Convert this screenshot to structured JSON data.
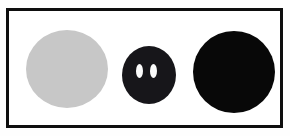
{
  "figure": {
    "title": "",
    "caption": "",
    "background_color": "#fefefe",
    "frame": {
      "border_color": "#0e0e0e",
      "border_width_px": 3,
      "interior_color": "#ffffff",
      "x": 6,
      "y": 8,
      "width": 277,
      "height": 120
    },
    "shape_count": "3"
  },
  "shapes": [
    {
      "id": "gray-disc",
      "label": "",
      "form": "circle",
      "fill_color": "#c7c7c7",
      "outline": "none",
      "center_x": 64,
      "center_y": 66,
      "width": 82,
      "height": 78,
      "holes": "0"
    },
    {
      "id": "dark-disc-with-holes",
      "label": "",
      "form": "circle",
      "fill_color": "#17161a",
      "outline": "none",
      "center_x": 146,
      "center_y": 72,
      "width": 54,
      "height": 58,
      "holes": "2",
      "hole_fill_color": "#fbfbfb",
      "hole_form": "vertical-ellipse",
      "hole_positions": [
        {
          "id": "aperture-left",
          "center_x": 137,
          "center_y": 68,
          "width": 7,
          "height": 14
        },
        {
          "id": "aperture-right",
          "center_x": 151,
          "center_y": 68,
          "width": 7,
          "height": 14
        }
      ]
    },
    {
      "id": "black-disc",
      "label": "",
      "form": "circle",
      "fill_color": "#080808",
      "outline": "none",
      "center_x": 231,
      "center_y": 72,
      "width": 82,
      "height": 82,
      "holes": "0"
    }
  ]
}
